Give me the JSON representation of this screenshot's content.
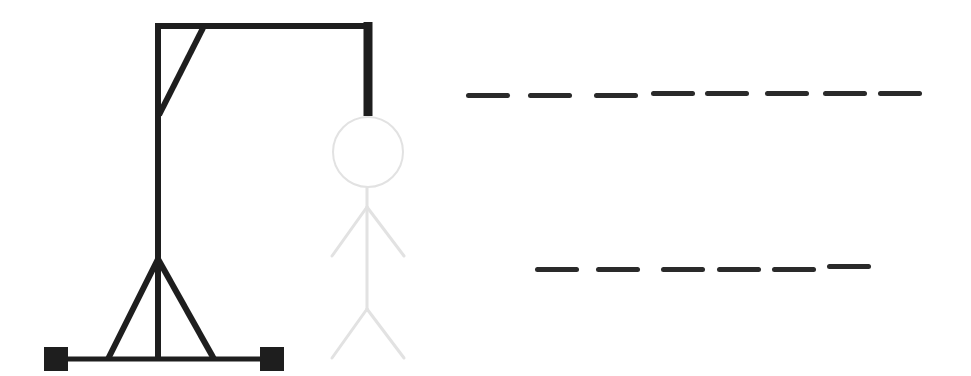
{
  "game": {
    "type": "hangman",
    "wrong_guesses_drawn": 0,
    "colors": {
      "gallows": "#1e1e1e",
      "figure_outline": "#e2e2e2",
      "dash": "#2a2a2a",
      "background": "#ffffff"
    },
    "gallows_parts": [
      "base-beam",
      "left-foot",
      "right-foot",
      "upright-post",
      "left-strut",
      "right-strut",
      "top-beam",
      "corner-brace",
      "rope"
    ],
    "figure_parts": [
      "head",
      "body",
      "left-arm",
      "right-arm",
      "left-leg",
      "right-leg"
    ],
    "word_rows": [
      {
        "row": 1,
        "letter_count": 8,
        "letters": [
          "",
          "",
          "",
          "",
          "",
          "",
          "",
          ""
        ],
        "dash_x": [
          466,
          528,
          594,
          651,
          705,
          765,
          823,
          878
        ],
        "dash_y": [
          93,
          93,
          93,
          91,
          91,
          91,
          91,
          91
        ]
      },
      {
        "row": 2,
        "letter_count": 6,
        "letters": [
          "",
          "",
          "",
          "",
          "",
          ""
        ],
        "dash_x": [
          535,
          596,
          661,
          717,
          772,
          827
        ],
        "dash_y": [
          267,
          267,
          267,
          267,
          267,
          264
        ]
      }
    ]
  }
}
